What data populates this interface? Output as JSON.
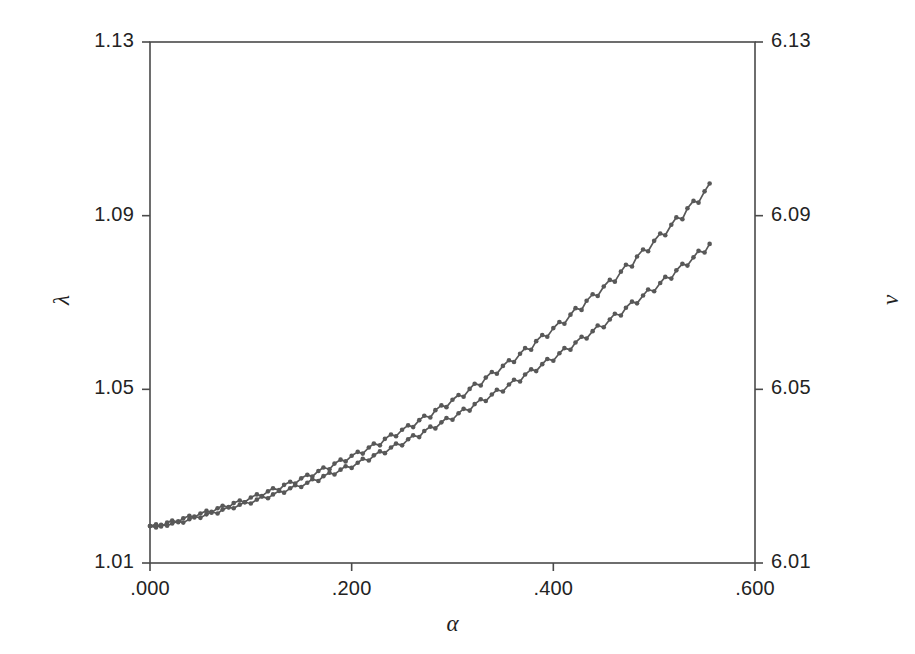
{
  "figure": {
    "background_color": "#ffffff",
    "frame_color": "#4a4a4a",
    "series_color": "#585858"
  },
  "chart_data": {
    "type": "line",
    "title": "",
    "subtitle": "",
    "xlabel": "α",
    "ylabel": "λ",
    "y2label": "ν",
    "xlim": [
      0.0,
      0.6
    ],
    "ylim": [
      1.01,
      1.13
    ],
    "y2lim": [
      6.01,
      6.13
    ],
    "grid": false,
    "legend": "none",
    "marker": "filled-circle",
    "xticks": [
      0.0,
      0.2,
      0.4,
      0.6
    ],
    "xtick_labels": [
      ".000",
      ".200",
      ".400",
      ".600"
    ],
    "yticks": [
      1.01,
      1.05,
      1.09,
      1.13
    ],
    "ytick_labels": [
      "1.01",
      "1.05",
      "1.09",
      "1.13"
    ],
    "y2ticks": [
      6.01,
      6.05,
      6.09,
      6.13
    ],
    "y2tick_labels": [
      "6.01",
      "6.05",
      "6.09",
      "6.13"
    ],
    "x": [
      0.0,
      0.006,
      0.011,
      0.017,
      0.022,
      0.028,
      0.033,
      0.039,
      0.044,
      0.05,
      0.056,
      0.061,
      0.067,
      0.072,
      0.078,
      0.083,
      0.089,
      0.094,
      0.1,
      0.106,
      0.111,
      0.117,
      0.122,
      0.128,
      0.133,
      0.139,
      0.144,
      0.15,
      0.156,
      0.161,
      0.167,
      0.172,
      0.178,
      0.183,
      0.189,
      0.194,
      0.2,
      0.206,
      0.211,
      0.217,
      0.222,
      0.228,
      0.233,
      0.239,
      0.244,
      0.25,
      0.256,
      0.261,
      0.267,
      0.272,
      0.278,
      0.283,
      0.289,
      0.294,
      0.3,
      0.306,
      0.311,
      0.317,
      0.322,
      0.328,
      0.333,
      0.339,
      0.344,
      0.35,
      0.356,
      0.361,
      0.367,
      0.372,
      0.378,
      0.383,
      0.389,
      0.394,
      0.4,
      0.406,
      0.411,
      0.417,
      0.422,
      0.428,
      0.433,
      0.439,
      0.444,
      0.45,
      0.456,
      0.461,
      0.467,
      0.472,
      0.478,
      0.483,
      0.489,
      0.494,
      0.5,
      0.506,
      0.511,
      0.517,
      0.522,
      0.528,
      0.533,
      0.539,
      0.544,
      0.55,
      0.555
    ],
    "series": [
      {
        "name": "lambda",
        "axis": "left",
        "values": [
          1.0185,
          1.0182,
          1.0188,
          1.0186,
          1.0191,
          1.0196,
          1.0193,
          1.0201,
          1.0207,
          1.0204,
          1.0212,
          1.0218,
          1.0214,
          1.0223,
          1.0229,
          1.0226,
          1.0234,
          1.024,
          1.0237,
          1.0246,
          1.0253,
          1.0249,
          1.0258,
          1.0266,
          1.0262,
          1.0272,
          1.0279,
          1.0275,
          1.0285,
          1.0293,
          1.0289,
          1.03,
          1.0308,
          1.0304,
          1.0315,
          1.0323,
          1.0319,
          1.0331,
          1.034,
          1.0336,
          1.0348,
          1.0357,
          1.0353,
          1.0366,
          1.0375,
          1.0371,
          1.0385,
          1.0394,
          1.039,
          1.0404,
          1.0414,
          1.041,
          1.0424,
          1.0434,
          1.043,
          1.0445,
          1.0455,
          1.0451,
          1.0466,
          1.0477,
          1.0473,
          1.0488,
          1.0499,
          1.0495,
          1.0511,
          1.0522,
          1.0518,
          1.0534,
          1.0546,
          1.0542,
          1.0558,
          1.057,
          1.0566,
          1.0583,
          1.0595,
          1.0591,
          1.0608,
          1.0621,
          1.0617,
          1.0634,
          1.0647,
          1.0643,
          1.0661,
          1.0674,
          1.067,
          1.0688,
          1.0702,
          1.0698,
          1.0716,
          1.073,
          1.0726,
          1.0745,
          1.0759,
          1.0755,
          1.0774,
          1.0789,
          1.0785,
          1.0804,
          1.0819,
          1.0815,
          1.0835
        ],
        "note": "lower of the two overlapping traces"
      },
      {
        "name": "nu",
        "axis": "right",
        "values": [
          6.0185,
          6.0189,
          6.0184,
          6.0193,
          6.0198,
          6.0194,
          6.0203,
          6.0209,
          6.0205,
          6.0214,
          6.022,
          6.0216,
          6.0226,
          6.0232,
          6.0228,
          6.0238,
          6.0244,
          6.024,
          6.0251,
          6.0258,
          6.0254,
          6.0265,
          6.0272,
          6.0268,
          6.028,
          6.0287,
          6.0283,
          6.0295,
          6.0303,
          6.0299,
          6.0312,
          6.032,
          6.0316,
          6.0329,
          6.0338,
          6.0334,
          6.0347,
          6.0356,
          6.0352,
          6.0366,
          6.0375,
          6.0371,
          6.0386,
          6.0396,
          6.0392,
          6.0407,
          6.0417,
          6.0413,
          6.0429,
          6.0439,
          6.0435,
          6.0452,
          6.0463,
          6.0459,
          6.0476,
          6.0487,
          6.0483,
          6.0501,
          6.0513,
          6.0509,
          6.0527,
          6.054,
          6.0536,
          6.0554,
          6.0567,
          6.0563,
          6.0582,
          6.0595,
          6.0591,
          6.0611,
          6.0625,
          6.0621,
          6.0641,
          6.0655,
          6.0651,
          6.0672,
          6.0687,
          6.0683,
          6.0704,
          6.0719,
          6.0715,
          6.0737,
          6.0752,
          6.0748,
          6.0771,
          6.0787,
          6.0783,
          6.0806,
          6.0822,
          6.0818,
          6.0842,
          6.0859,
          6.0855,
          6.0879,
          6.0896,
          6.0892,
          6.0917,
          6.0934,
          6.093,
          6.0956,
          6.0974
        ],
        "note": "upper of the two overlapping traces"
      }
    ]
  }
}
